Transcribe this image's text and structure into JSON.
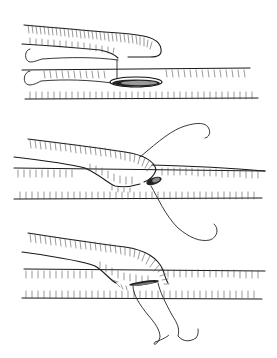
{
  "figure": {
    "panels": [
      {
        "step": 1,
        "name": "stay-suture-placement"
      },
      {
        "step": 2,
        "name": "heel-suture-running"
      },
      {
        "step": 3,
        "name": "anastomosis-completion"
      }
    ],
    "colors": {
      "line": "#1a1a1a",
      "hatch": "#555555",
      "background": "#ffffff"
    }
  }
}
